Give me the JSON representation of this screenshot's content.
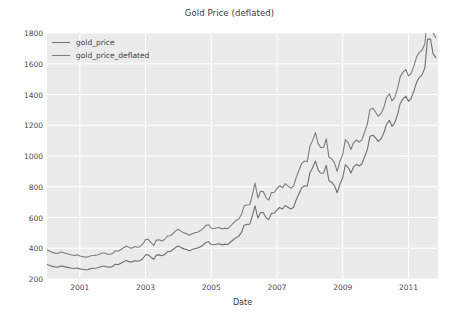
{
  "chart_data": {
    "type": "line",
    "title": "Gold Price (deflated)",
    "xlabel": "Date",
    "ylabel": "",
    "xlim": [
      2000.0,
      2011.9
    ],
    "ylim": [
      200,
      1800
    ],
    "grid": true,
    "legend_position": "upper left",
    "xticks": [
      2001,
      2003,
      2005,
      2007,
      2009,
      2011
    ],
    "xtick_labels": [
      "2001",
      "2003",
      "2005",
      "2007",
      "2009",
      "2011"
    ],
    "yticks": [
      200,
      400,
      600,
      800,
      1000,
      1200,
      1400,
      1600,
      1800
    ],
    "ytick_labels": [
      "200",
      "400",
      "600",
      "800",
      "1000",
      "1200",
      "1400",
      "1600",
      "1800"
    ],
    "series": [
      {
        "name": "gold_price",
        "color": "#6f6f6f",
        "x": [
          2000.0,
          2000.08,
          2000.17,
          2000.25,
          2000.33,
          2000.42,
          2000.5,
          2000.58,
          2000.67,
          2000.75,
          2000.83,
          2000.92,
          2001.0,
          2001.08,
          2001.17,
          2001.25,
          2001.33,
          2001.42,
          2001.5,
          2001.58,
          2001.67,
          2001.75,
          2001.83,
          2001.92,
          2002.0,
          2002.08,
          2002.17,
          2002.25,
          2002.33,
          2002.42,
          2002.5,
          2002.58,
          2002.67,
          2002.75,
          2002.83,
          2002.92,
          2003.0,
          2003.08,
          2003.17,
          2003.25,
          2003.33,
          2003.42,
          2003.5,
          2003.58,
          2003.67,
          2003.75,
          2003.83,
          2003.92,
          2004.0,
          2004.08,
          2004.17,
          2004.25,
          2004.33,
          2004.42,
          2004.5,
          2004.58,
          2004.67,
          2004.75,
          2004.83,
          2004.92,
          2005.0,
          2005.08,
          2005.17,
          2005.25,
          2005.33,
          2005.42,
          2005.5,
          2005.58,
          2005.67,
          2005.75,
          2005.83,
          2005.92,
          2006.0,
          2006.08,
          2006.17,
          2006.25,
          2006.33,
          2006.42,
          2006.5,
          2006.58,
          2006.67,
          2006.75,
          2006.83,
          2006.92,
          2007.0,
          2007.08,
          2007.17,
          2007.25,
          2007.33,
          2007.42,
          2007.5,
          2007.58,
          2007.67,
          2007.75,
          2007.83,
          2007.92,
          2008.0,
          2008.08,
          2008.17,
          2008.25,
          2008.33,
          2008.42,
          2008.5,
          2008.58,
          2008.67,
          2008.75,
          2008.83,
          2008.92,
          2009.0,
          2009.08,
          2009.17,
          2009.25,
          2009.33,
          2009.42,
          2009.5,
          2009.58,
          2009.67,
          2009.75,
          2009.83,
          2009.92,
          2010.0,
          2010.08,
          2010.17,
          2010.25,
          2010.33,
          2010.42,
          2010.5,
          2010.58,
          2010.67,
          2010.75,
          2010.83,
          2010.92,
          2011.0,
          2011.08,
          2011.17,
          2011.25,
          2011.33,
          2011.42,
          2011.5,
          2011.58,
          2011.67,
          2011.75,
          2011.83
        ],
        "values": [
          296,
          288,
          282,
          278,
          277,
          285,
          282,
          277,
          274,
          270,
          268,
          271,
          266,
          263,
          260,
          261,
          268,
          270,
          272,
          275,
          283,
          283,
          278,
          277,
          282,
          296,
          294,
          303,
          312,
          321,
          313,
          310,
          319,
          316,
          319,
          333,
          357,
          358,
          340,
          328,
          355,
          357,
          351,
          359,
          378,
          379,
          390,
          406,
          414,
          404,
          396,
          392,
          384,
          392,
          398,
          401,
          410,
          421,
          437,
          442,
          424,
          423,
          428,
          429,
          422,
          427,
          424,
          439,
          455,
          469,
          477,
          503,
          550,
          555,
          557,
          610,
          676,
          596,
          633,
          632,
          598,
          586,
          627,
          629,
          650,
          665,
          655,
          678,
          667,
          655,
          665,
          712,
          754,
          792,
          806,
          803,
          890,
          922,
          968,
          910,
          888,
          889,
          939,
          839,
          829,
          807,
          761,
          820,
          858,
          943,
          925,
          890,
          929,
          946,
          935,
          948,
          997,
          1043,
          1128,
          1135,
          1118,
          1095,
          1113,
          1149,
          1205,
          1232,
          1193,
          1215,
          1271,
          1342,
          1370,
          1390,
          1356,
          1373,
          1424,
          1480,
          1510,
          1530,
          1573,
          1760,
          1761,
          1666,
          1640
        ]
      },
      {
        "name": "gold_price_deflated",
        "color": "#7d7d7d",
        "x": [
          2000.0,
          2000.08,
          2000.17,
          2000.25,
          2000.33,
          2000.42,
          2000.5,
          2000.58,
          2000.67,
          2000.75,
          2000.83,
          2000.92,
          2001.0,
          2001.08,
          2001.17,
          2001.25,
          2001.33,
          2001.42,
          2001.5,
          2001.58,
          2001.67,
          2001.75,
          2001.83,
          2001.92,
          2002.0,
          2002.08,
          2002.17,
          2002.25,
          2002.33,
          2002.42,
          2002.5,
          2002.58,
          2002.67,
          2002.75,
          2002.83,
          2002.92,
          2003.0,
          2003.08,
          2003.17,
          2003.25,
          2003.33,
          2003.42,
          2003.5,
          2003.58,
          2003.67,
          2003.75,
          2003.83,
          2003.92,
          2004.0,
          2004.08,
          2004.17,
          2004.25,
          2004.33,
          2004.42,
          2004.5,
          2004.58,
          2004.67,
          2004.75,
          2004.83,
          2004.92,
          2005.0,
          2005.08,
          2005.17,
          2005.25,
          2005.33,
          2005.42,
          2005.5,
          2005.58,
          2005.67,
          2005.75,
          2005.83,
          2005.92,
          2006.0,
          2006.08,
          2006.17,
          2006.25,
          2006.33,
          2006.42,
          2006.5,
          2006.58,
          2006.67,
          2006.75,
          2006.83,
          2006.92,
          2007.0,
          2007.08,
          2007.17,
          2007.25,
          2007.33,
          2007.42,
          2007.5,
          2007.58,
          2007.67,
          2007.75,
          2007.83,
          2007.92,
          2008.0,
          2008.08,
          2008.17,
          2008.25,
          2008.33,
          2008.42,
          2008.5,
          2008.58,
          2008.67,
          2008.75,
          2008.83,
          2008.92,
          2009.0,
          2009.08,
          2009.17,
          2009.25,
          2009.33,
          2009.42,
          2009.5,
          2009.58,
          2009.67,
          2009.75,
          2009.83,
          2009.92,
          2010.0,
          2010.08,
          2010.17,
          2010.25,
          2010.33,
          2010.42,
          2010.5,
          2010.58,
          2010.67,
          2010.75,
          2010.83,
          2010.92,
          2011.0,
          2011.08,
          2011.17,
          2011.25,
          2011.33,
          2011.42,
          2011.5,
          2011.58,
          2011.67,
          2011.75,
          2011.83
        ],
        "values": [
          391,
          381,
          373,
          368,
          366,
          376,
          372,
          366,
          361,
          356,
          353,
          357,
          350,
          346,
          342,
          343,
          351,
          353,
          355,
          359,
          369,
          369,
          362,
          361,
          367,
          384,
          381,
          392,
          403,
          414,
          404,
          400,
          411,
          407,
          410,
          428,
          457,
          458,
          435,
          419,
          453,
          455,
          447,
          457,
          480,
          481,
          494,
          514,
          523,
          510,
          500,
          494,
          484,
          494,
          501,
          504,
          515,
          528,
          547,
          553,
          530,
          528,
          533,
          534,
          525,
          531,
          527,
          544,
          563,
          580,
          589,
          620,
          676,
          681,
          683,
          746,
          824,
          727,
          771,
          769,
          728,
          713,
          762,
          764,
          788,
          806,
          793,
          820,
          806,
          791,
          803,
          858,
          907,
          951,
          967,
          963,
          1063,
          1100,
          1152,
          1082,
          1055,
          1055,
          1112,
          993,
          981,
          955,
          900,
          968,
          1009,
          1107,
          1085,
          1042,
          1086,
          1104,
          1090,
          1104,
          1158,
          1209,
          1303,
          1310,
          1286,
          1259,
          1277,
          1315,
          1377,
          1405,
          1358,
          1380,
          1440,
          1516,
          1544,
          1563,
          1521,
          1536,
          1588,
          1645,
          1673,
          1690,
          1730,
          1908,
          1905,
          1800,
          1770
        ]
      }
    ]
  },
  "legend": {
    "entries": [
      {
        "label": "gold_price"
      },
      {
        "label": "gold_price_deflated"
      }
    ]
  }
}
